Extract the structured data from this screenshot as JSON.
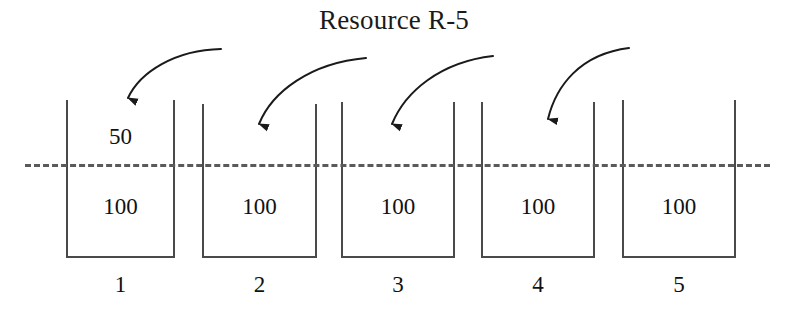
{
  "title": "Resource R-5",
  "threshold": {
    "style": "dashed",
    "color": "#5a5a5a",
    "y": 164,
    "x_start": 25,
    "x_end": 770
  },
  "bins": [
    {
      "label": "1",
      "base_amount": "100",
      "incoming_amount": "50",
      "x": 66,
      "width": 109,
      "top": 100,
      "bottom": 258
    },
    {
      "label": "2",
      "base_amount": "100",
      "incoming_amount": "",
      "x": 202,
      "width": 115,
      "top": 104,
      "bottom": 258
    },
    {
      "label": "3",
      "base_amount": "100",
      "incoming_amount": "",
      "x": 341,
      "width": 114,
      "top": 102,
      "bottom": 258
    },
    {
      "label": "4",
      "base_amount": "100",
      "incoming_amount": "",
      "x": 481,
      "width": 114,
      "top": 102,
      "bottom": 258
    },
    {
      "label": "5",
      "base_amount": "100",
      "incoming_amount": "",
      "x": 622,
      "width": 114,
      "top": 100,
      "bottom": 258
    }
  ],
  "arrows": [
    {
      "name": "arrow-to-bin-1",
      "target_bin": "1",
      "path": "M 221 49 C 175 50 140 72 128 98",
      "tip_x": 128,
      "tip_y": 107
    },
    {
      "name": "arrow-to-bin-2",
      "target_bin": "2",
      "path": "M 366 58 C 310 63 272 92 259 124",
      "tip_x": 259,
      "tip_y": 133
    },
    {
      "name": "arrow-to-bin-3",
      "target_bin": "3",
      "path": "M 493 56 C 440 62 405 92 392 124",
      "tip_x": 392,
      "tip_y": 133
    },
    {
      "name": "arrow-to-bin-4",
      "target_bin": "4",
      "path": "M 629 48 C 580 54 556 86 548 119",
      "tip_x": 548,
      "tip_y": 128
    }
  ],
  "colors": {
    "stroke": "#4a4a4a",
    "text": "#111111",
    "arrow": "#1a1a1a",
    "background": "#ffffff"
  }
}
